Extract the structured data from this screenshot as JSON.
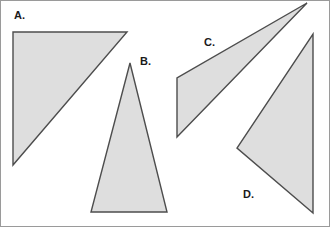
{
  "figure": {
    "width": 330,
    "height": 227,
    "background_color": "#ffffff",
    "border": {
      "color": "#9a9a9a",
      "width": 1,
      "x": 0.5,
      "y": 0.5,
      "w": 329,
      "h": 226
    },
    "style": {
      "fill_color": "#dedede",
      "stroke_color": "#4d4d4d",
      "stroke_width": 1.4,
      "label_color": "#1a1a1a",
      "label_font_size": 11
    },
    "shapes": [
      {
        "id": "triangle-a",
        "label": "A.",
        "label_x": 14,
        "label_y": 16,
        "points": "13,32 127,32 13,165",
        "vertices": [
          [
            13,
            32
          ],
          [
            127,
            32
          ],
          [
            13,
            165
          ]
        ]
      },
      {
        "id": "triangle-b",
        "label": "B.",
        "label_x": 140,
        "label_y": 62,
        "points": "130,63 167,212 91,212",
        "vertices": [
          [
            130,
            63
          ],
          [
            167,
            212
          ],
          [
            91,
            212
          ]
        ]
      },
      {
        "id": "triangle-c",
        "label": "C.",
        "label_x": 204,
        "label_y": 43,
        "points": "307,3 177,137 177,78",
        "vertices": [
          [
            307,
            3
          ],
          [
            177,
            137
          ],
          [
            177,
            78
          ]
        ]
      },
      {
        "id": "triangle-d",
        "label": "D.",
        "label_x": 243,
        "label_y": 195,
        "points": "313,34 313,213 237,148",
        "vertices": [
          [
            313,
            34
          ],
          [
            313,
            213
          ],
          [
            237,
            148
          ]
        ]
      }
    ]
  }
}
